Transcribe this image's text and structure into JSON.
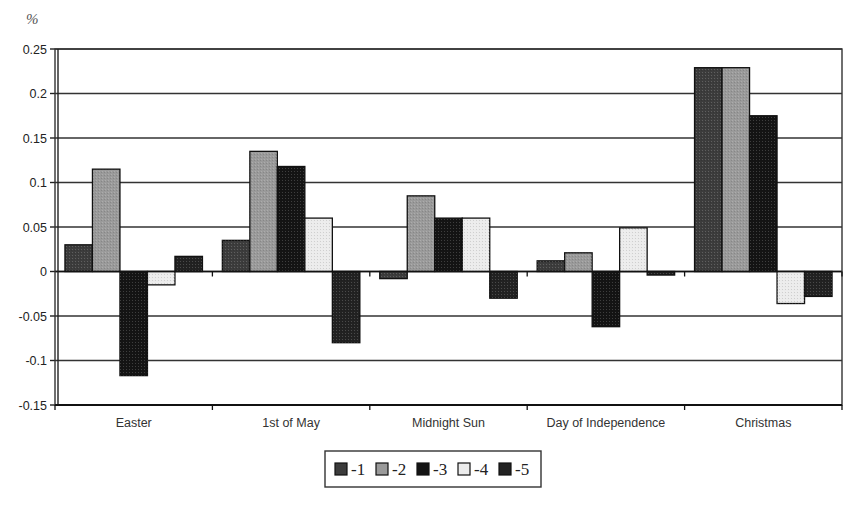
{
  "chart_data": {
    "type": "bar",
    "title": "",
    "ylabel": "%",
    "xlabel": "",
    "ylim": [
      -0.15,
      0.25
    ],
    "yticks": [
      0.25,
      0.2,
      0.15,
      0.1,
      0.05,
      0,
      -0.05,
      -0.1,
      -0.15
    ],
    "ytick_labels": [
      "0.25",
      "0.2",
      "0.15",
      "0.1",
      "0.05",
      "0",
      "-0.05",
      "-0.1",
      "-0.15"
    ],
    "grid": true,
    "legend_position": "bottom",
    "categories": [
      "Easter",
      "1st of May",
      "Midnight Sun",
      "Day of Independence",
      "Christmas"
    ],
    "series": [
      {
        "name": "-1",
        "color": "#3c3c3c",
        "values": [
          0.03,
          0.035,
          -0.008,
          0.012,
          0.229
        ]
      },
      {
        "name": "-2",
        "color": "#9a9a9a",
        "values": [
          0.115,
          0.135,
          0.085,
          0.021,
          0.229
        ]
      },
      {
        "name": "-3",
        "color": "#141414",
        "values": [
          -0.117,
          0.118,
          0.06,
          -0.062,
          0.175
        ]
      },
      {
        "name": "-4",
        "color": "#ececec",
        "values": [
          -0.015,
          0.06,
          0.06,
          0.049,
          -0.036
        ]
      },
      {
        "name": "-5",
        "color": "#222222",
        "values": [
          0.017,
          -0.08,
          -0.03,
          -0.004,
          -0.028
        ]
      }
    ]
  }
}
